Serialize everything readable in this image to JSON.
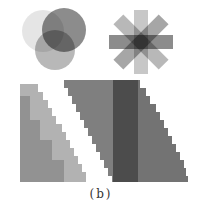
{
  "figure": {
    "caption": "(b)",
    "panels": [
      {
        "name": "overlapping-circles",
        "count": 3
      },
      {
        "name": "asterisk-star",
        "bars": 4
      },
      {
        "name": "staircase-triangle"
      },
      {
        "name": "staircase-parallelogram"
      }
    ],
    "colors": {
      "background": "#ffffff",
      "shape_gray": "#555555"
    }
  }
}
